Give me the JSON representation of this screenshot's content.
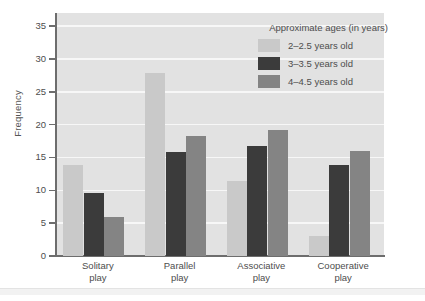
{
  "chart_data": {
    "type": "bar",
    "title": "",
    "xlabel": "",
    "ylabel": "Frequency",
    "ylim": [
      0,
      37
    ],
    "yticks": [
      0,
      5,
      10,
      15,
      20,
      25,
      30,
      35
    ],
    "grid": true,
    "legend_position": "top-right",
    "legend_title": "Approximate ages (in years)",
    "categories": [
      "Solitary\nplay",
      "Parallel\nplay",
      "Associative\nplay",
      "Cooperative\nplay"
    ],
    "series": [
      {
        "name": "2–2.5 years old",
        "color": "#c9c9c9",
        "values": [
          13.8,
          27.9,
          11.4,
          3.0
        ]
      },
      {
        "name": "3–3.5 years old",
        "color": "#3b3b3b",
        "values": [
          9.6,
          15.8,
          16.7,
          13.8
        ]
      },
      {
        "name": "4–4.5 years old",
        "color": "#848484",
        "values": [
          6.0,
          18.3,
          19.2,
          16.0
        ]
      }
    ]
  },
  "colors": {
    "plot_background": "#e2e2e2",
    "gridline": "#f7f7f7",
    "axis": "#6d6d6d",
    "text": "#4d4d4d",
    "page_background": "#ffffff"
  }
}
